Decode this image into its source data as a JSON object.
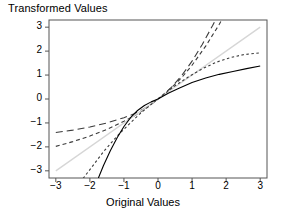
{
  "chart_data": {
    "type": "line",
    "title": "Transformed Values",
    "xlabel": "Original Values",
    "ylabel": "Transformed Values",
    "xlim": [
      -3.2,
      3.2
    ],
    "ylim": [
      -3.3,
      3.3
    ],
    "xticks": [
      "-3",
      "-2",
      "-1",
      "0",
      "1",
      "2",
      "3"
    ],
    "xtick_values": [
      -3,
      -2,
      -1,
      0,
      1,
      2,
      3
    ],
    "yticks": [
      "3",
      "2",
      "1",
      "0",
      "-1",
      "-2",
      "-3"
    ],
    "ytick_values": [
      3,
      2,
      1,
      0,
      -1,
      -2,
      -3
    ],
    "grid": false,
    "legend": "none",
    "series": [
      {
        "name": "lambda = -1 (reciprocal family)",
        "style": "long-dash",
        "color": "#3b3b3b",
        "x": [
          -3.0,
          -2.5,
          -2.0,
          -1.5,
          -1.0,
          -0.7,
          -0.4,
          -0.2,
          -0.1,
          0.0,
          0.1,
          0.2,
          0.4,
          0.7,
          1.0,
          1.3,
          1.6,
          1.9,
          2.1
        ],
        "y": [
          -1.4,
          -1.3,
          -1.17,
          -1.0,
          -0.78,
          -0.62,
          -0.4,
          -0.21,
          -0.11,
          0.0,
          0.11,
          0.23,
          0.5,
          0.99,
          1.58,
          2.28,
          3.06,
          3.9,
          4.4
        ]
      },
      {
        "name": "lambda = -0.5 (inverse sqrt family)",
        "style": "medium-dash",
        "color": "#3b3b3b",
        "x": [
          -3.0,
          -2.5,
          -2.0,
          -1.5,
          -1.0,
          -0.7,
          -0.4,
          -0.2,
          -0.1,
          0.0,
          0.1,
          0.2,
          0.4,
          0.7,
          1.0,
          1.4,
          1.8,
          2.2,
          2.4
        ],
        "y": [
          -1.98,
          -1.78,
          -1.55,
          -1.27,
          -0.93,
          -0.71,
          -0.44,
          -0.22,
          -0.11,
          0.0,
          0.11,
          0.23,
          0.48,
          0.9,
          1.41,
          2.21,
          3.12,
          4.14,
          4.68
        ]
      },
      {
        "name": "lambda = 1 (identity)",
        "style": "solid-light",
        "color": "#d6d6d6",
        "x": [
          -3.0,
          0.0,
          3.0
        ],
        "y": [
          -3.0,
          0.0,
          3.0
        ]
      },
      {
        "name": "lambda = 2 (square family)",
        "style": "short-dash",
        "color": "#3b3b3b",
        "x": [
          -2.2,
          -2.0,
          -1.6,
          -1.2,
          -0.8,
          -0.5,
          -0.25,
          0.0,
          0.25,
          0.5,
          0.9,
          1.3,
          1.7,
          2.1,
          2.5,
          3.0
        ],
        "y": [
          -3.32,
          -2.95,
          -2.2,
          -1.55,
          -0.98,
          -0.58,
          -0.28,
          0.0,
          0.28,
          0.55,
          0.93,
          1.26,
          1.53,
          1.72,
          1.85,
          1.93
        ]
      },
      {
        "name": "lambda = 0 (log family)",
        "style": "solid",
        "color": "#000000",
        "x": [
          -1.75,
          -1.6,
          -1.4,
          -1.2,
          -1.0,
          -0.8,
          -0.6,
          -0.4,
          -0.2,
          0.0,
          0.3,
          0.6,
          1.0,
          1.4,
          1.8,
          2.2,
          2.6,
          3.0
        ],
        "y": [
          -3.3,
          -2.78,
          -2.16,
          -1.62,
          -1.15,
          -0.77,
          -0.48,
          -0.27,
          -0.12,
          0.0,
          0.24,
          0.44,
          0.69,
          0.88,
          1.03,
          1.15,
          1.27,
          1.38
        ]
      }
    ]
  }
}
